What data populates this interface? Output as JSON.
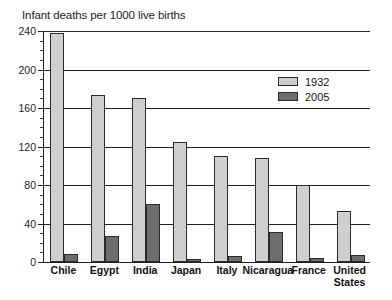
{
  "chart_data": {
    "type": "bar",
    "title": "Infant deaths per 1000 live births",
    "xlabel": "",
    "ylabel": "",
    "ylim": [
      0,
      240
    ],
    "ytick_step": 40,
    "yminor_step": 10,
    "yticks": [
      0,
      40,
      80,
      120,
      160,
      200,
      240
    ],
    "grid": true,
    "legend_position": "top-right",
    "categories": [
      "Chile",
      "Egypt",
      "India",
      "Japan",
      "Italy",
      "Nicaragua",
      "France",
      "United States"
    ],
    "category_lines": [
      [
        "Chile"
      ],
      [
        "Egypt"
      ],
      [
        "India"
      ],
      [
        "Japan"
      ],
      [
        "Italy"
      ],
      [
        "Nicaragua"
      ],
      [
        "France"
      ],
      [
        "United",
        "States"
      ]
    ],
    "series": [
      {
        "name": "1932",
        "color": "#cfcfcf",
        "values": [
          238,
          174,
          170,
          125,
          110,
          108,
          80,
          53
        ]
      },
      {
        "name": "2005",
        "color": "#6e6e6e",
        "values": [
          8,
          27,
          60,
          3,
          6,
          31,
          4,
          7
        ]
      }
    ]
  },
  "axis": {
    "tick_labels": [
      "240",
      "200",
      "160",
      "120",
      "80",
      "40",
      "0"
    ]
  },
  "legend": {
    "entries": [
      {
        "label": "1932"
      },
      {
        "label": "2005"
      }
    ]
  },
  "colors": {
    "series_1932": "#cfcfcf",
    "series_2005": "#6e6e6e",
    "axis": "#1f1f1f",
    "background": "#ffffff"
  }
}
